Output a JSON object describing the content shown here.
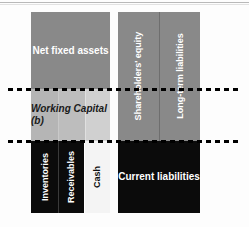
{
  "figure": {
    "name": "balance-sheet-structure-diagram",
    "canvas": {
      "width": 249,
      "height": 227,
      "background": "#fdfdfd"
    }
  },
  "assets_side": {
    "net_fixed_assets": {
      "label": "Net fixed assets",
      "color": "#898989",
      "text_color": "#ffffff"
    },
    "working_capital": {
      "label": "Working Capital (b)",
      "color": "#b5b5b5",
      "text_color": "#1a1a1a"
    },
    "current_assets": [
      {
        "label": "Inventories",
        "color": "#0b0b0b",
        "text_color": "#ffffff",
        "orientation": "vertical"
      },
      {
        "label": "Receivables",
        "color": "#0b0b0b",
        "text_color": "#ffffff",
        "orientation": "vertical"
      },
      {
        "label": "Cash",
        "color": "#f4f4f4",
        "text_color": "#111111",
        "orientation": "vertical"
      }
    ]
  },
  "liabilities_side": {
    "long_term": [
      {
        "label": "Shareholders' equity",
        "color": "#898989",
        "text_color": "#ffffff",
        "orientation": "vertical"
      },
      {
        "label": "Long-term liabilities",
        "color": "#898989",
        "text_color": "#ffffff",
        "orientation": "vertical"
      }
    ],
    "current_liabilities": {
      "label": "Current liabilities",
      "color": "#0b0b0b",
      "text_color": "#ffffff"
    }
  },
  "separators": {
    "style": "dashed",
    "color": "#000000",
    "count": 2
  }
}
